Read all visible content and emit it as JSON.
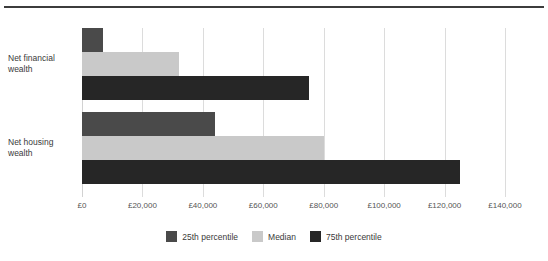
{
  "chart_data": {
    "type": "bar",
    "orientation": "horizontal",
    "title": "",
    "xlabel": "",
    "ylabel": "",
    "categories": [
      "Net financial wealth",
      "Net housing wealth"
    ],
    "category_labels": [
      {
        "line1": "Net financial",
        "line2": "wealth"
      },
      {
        "line1": "Net housing",
        "line2": "wealth"
      }
    ],
    "series": [
      {
        "name": "25th percentile",
        "color": "#4a4a4a",
        "values": [
          7000,
          44000
        ]
      },
      {
        "name": "Median",
        "color": "#c9c9c9",
        "values": [
          32000,
          80000
        ]
      },
      {
        "name": "75th percentile",
        "color": "#262626",
        "values": [
          75000,
          125000
        ]
      }
    ],
    "xlim": [
      0,
      140000
    ],
    "xticks": [
      0,
      20000,
      40000,
      60000,
      80000,
      100000,
      120000,
      140000
    ],
    "xtick_labels": [
      "£0",
      "£20,000",
      "£40,000",
      "£60,000",
      "£80,000",
      "£100,000",
      "£120,000",
      "£140,000"
    ],
    "grid": "vertical",
    "legend_position": "bottom-center",
    "currency_symbol": "£"
  },
  "legend": {
    "items": [
      {
        "label": "25th percentile",
        "color": "#4a4a4a"
      },
      {
        "label": "Median",
        "color": "#c9c9c9"
      },
      {
        "label": "75th percentile",
        "color": "#262626"
      }
    ]
  },
  "style": {
    "background": "#ffffff",
    "rule_color": "#3c3c3c",
    "gridline_color": "#dcdcdc",
    "text_color": "#3a3a3a"
  }
}
